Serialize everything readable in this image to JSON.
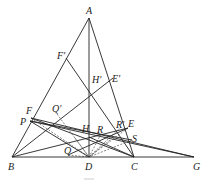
{
  "diagram": {
    "type": "geometry",
    "caption": "图",
    "points": {
      "A": [
        89,
        18
      ],
      "B": [
        12,
        157
      ],
      "C": [
        134,
        157
      ],
      "D": [
        89,
        157
      ],
      "G": [
        194,
        157
      ],
      "F'": [
        66,
        58
      ],
      "E'": [
        113,
        78
      ],
      "H'": [
        89,
        89
      ],
      "F": [
        31,
        118
      ],
      "P": [
        30,
        121
      ],
      "Q'": [
        57,
        114
      ],
      "H": [
        89,
        137
      ],
      "R": [
        101,
        134
      ],
      "R'": [
        121,
        127
      ],
      "E": [
        128,
        128
      ],
      "S": [
        132,
        140
      ],
      "Q": [
        68,
        155
      ]
    },
    "labels": [
      {
        "id": "A",
        "text": "A",
        "x": 86,
        "y": 14
      },
      {
        "id": "F'",
        "text": "F′",
        "x": 57,
        "y": 59
      },
      {
        "id": "H'",
        "text": "H′",
        "x": 92,
        "y": 83
      },
      {
        "id": "E'",
        "text": "E′",
        "x": 112,
        "y": 82
      },
      {
        "id": "F",
        "text": "F",
        "x": 26,
        "y": 114
      },
      {
        "id": "Q'",
        "text": "Q′",
        "x": 52,
        "y": 112
      },
      {
        "id": "P",
        "text": "P",
        "x": 20,
        "y": 125
      },
      {
        "id": "H",
        "text": "H",
        "x": 82,
        "y": 132
      },
      {
        "id": "R",
        "text": "R",
        "x": 97,
        "y": 133
      },
      {
        "id": "R'",
        "text": "R′",
        "x": 116,
        "y": 128
      },
      {
        "id": "E",
        "text": "E",
        "x": 128,
        "y": 127
      },
      {
        "id": "S",
        "text": "S",
        "x": 132,
        "y": 142
      },
      {
        "id": "Q",
        "text": "Q",
        "x": 64,
        "y": 154
      },
      {
        "id": "B",
        "text": "B",
        "x": 8,
        "y": 170
      },
      {
        "id": "D",
        "text": "D",
        "x": 85,
        "y": 170
      },
      {
        "id": "C",
        "text": "C",
        "x": 131,
        "y": 170
      },
      {
        "id": "G",
        "text": "G",
        "x": 193,
        "y": 170
      }
    ]
  }
}
